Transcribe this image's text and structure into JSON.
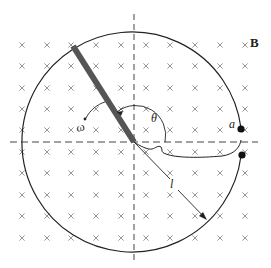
{
  "figure": {
    "labels": {
      "field": "B",
      "point_a": "a",
      "angle": "θ",
      "angular_velocity": "ω",
      "length": "l"
    },
    "colors": {
      "ink": "#222222",
      "grid_mark": "#8a8a8a",
      "rod": "#555555",
      "background": "#ffffff"
    },
    "field_marks": {
      "symbol": "×",
      "columns_x": [
        22,
        47,
        71,
        96,
        121,
        146,
        170,
        195,
        220,
        245
      ],
      "rows_y": [
        45,
        66,
        88,
        109,
        130,
        152,
        173,
        195,
        216,
        238
      ]
    },
    "circle": {
      "cx": 134,
      "cy": 142,
      "r": 110
    }
  }
}
